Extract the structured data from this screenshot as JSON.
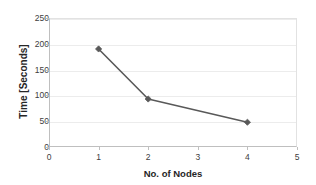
{
  "chart_data": {
    "type": "line",
    "title": "",
    "xlabel": "No. of Nodes",
    "ylabel": "Time [Seconds]",
    "x": [
      1,
      2,
      4
    ],
    "values": [
      190,
      93,
      48
    ],
    "series": [
      {
        "name": "Time",
        "x": [
          1,
          2,
          4
        ],
        "values": [
          190,
          93,
          48
        ],
        "color": "#595959",
        "marker": "diamond"
      }
    ],
    "xlim": [
      0,
      5
    ],
    "ylim": [
      0,
      250
    ],
    "xticks": [
      0,
      1,
      2,
      3,
      4,
      5
    ],
    "yticks": [
      0,
      50,
      100,
      150,
      200,
      250
    ],
    "xtick_labels": [
      "0",
      "1",
      "2",
      "3",
      "4",
      "5"
    ],
    "ytick_labels": [
      "0",
      "50",
      "100",
      "150",
      "200",
      "250"
    ],
    "grid": "horizontal",
    "legend": "none",
    "plot_background": "#ffffff",
    "gridline_color": "#ececec",
    "axis_color": "#bfbfbf",
    "text_color": "#262626"
  }
}
